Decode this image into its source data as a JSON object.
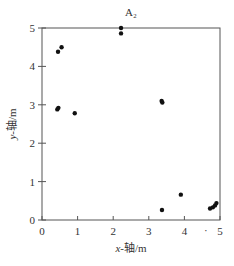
{
  "chart_data": {
    "type": "scatter",
    "title": "A₂",
    "xlabel": "x-轴/m",
    "ylabel": "y-轴/m",
    "xlim": [
      0,
      5
    ],
    "ylim": [
      0,
      5
    ],
    "xticks": [
      0,
      1,
      2,
      3,
      4,
      5
    ],
    "yticks": [
      0,
      1,
      2,
      3,
      4,
      5
    ],
    "grid": false,
    "series": [
      {
        "name": "points",
        "color": "#111111",
        "points": [
          {
            "x": 0.45,
            "y": 4.38
          },
          {
            "x": 0.55,
            "y": 4.5
          },
          {
            "x": 0.43,
            "y": 2.88
          },
          {
            "x": 0.46,
            "y": 2.92
          },
          {
            "x": 0.92,
            "y": 2.78
          },
          {
            "x": 2.22,
            "y": 5.0
          },
          {
            "x": 2.22,
            "y": 4.86
          },
          {
            "x": 3.36,
            "y": 3.1
          },
          {
            "x": 3.38,
            "y": 3.06
          },
          {
            "x": 3.37,
            "y": 0.26
          },
          {
            "x": 3.9,
            "y": 0.66
          },
          {
            "x": 4.72,
            "y": 0.3
          },
          {
            "x": 4.8,
            "y": 0.33
          },
          {
            "x": 4.86,
            "y": 0.38
          },
          {
            "x": 4.9,
            "y": 0.44
          }
        ]
      }
    ],
    "annotations": [
      {
        "text": "·",
        "x": 4.6,
        "y": -0.28
      }
    ]
  },
  "colors": {
    "axis": "#555555",
    "marker": "#111111"
  }
}
